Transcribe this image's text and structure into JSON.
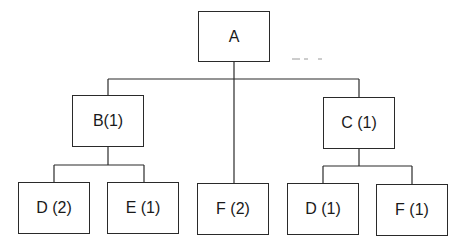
{
  "diagram": {
    "type": "tree",
    "root": {
      "label": "A",
      "children": [
        {
          "label": "B(1)",
          "children": [
            {
              "label": "D (2)"
            },
            {
              "label": "E (1)"
            }
          ]
        },
        {
          "label": "F (2)"
        },
        {
          "label": "C (1)",
          "children": [
            {
              "label": "D (1)"
            },
            {
              "label": "F (1)"
            }
          ]
        }
      ]
    },
    "nodes": {
      "a": "A",
      "b": "B(1)",
      "c": "C (1)",
      "d2": "D (2)",
      "e1": "E (1)",
      "f2": "F (2)",
      "d1": "D (1)",
      "f1": "F (1)"
    }
  }
}
